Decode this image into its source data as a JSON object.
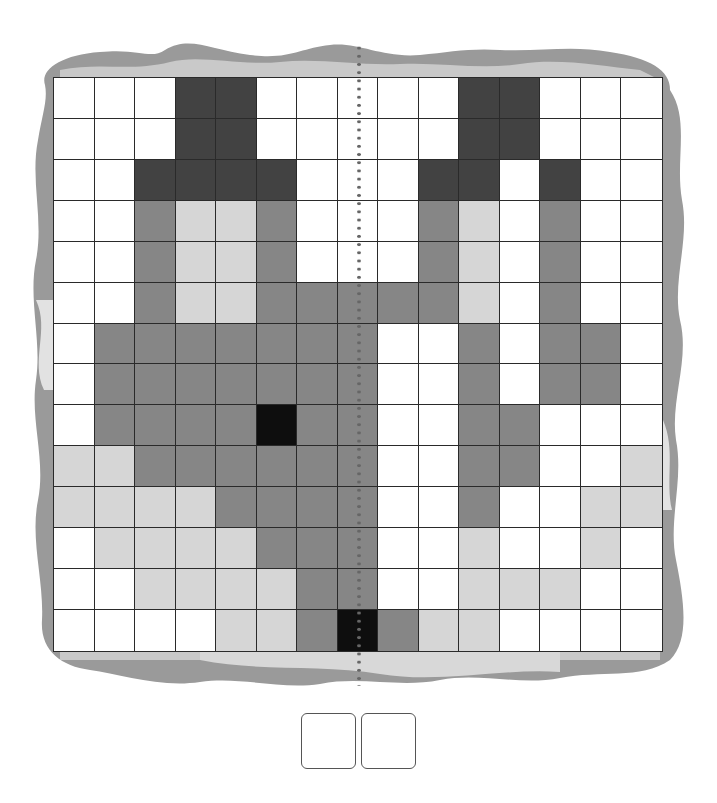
{
  "puzzle": {
    "type": "symmetry-coloring-grid",
    "columns": 15,
    "rows": 14,
    "mirror_axis": "vertical-dotted-line",
    "palette": {
      "W": "#ffffff",
      "L": "#d6d6d6",
      "M": "#868686",
      "D": "#424242",
      "K": "#0e0e0e"
    },
    "cells": [
      "WWWDDWWWWWDDWWW",
      "WWWDDWWWWWDDWWW",
      "WWDDDDWWWDDWDWW",
      "WWMLLMWWWMLWMWW",
      "WWMLLMWWWMLWMWW",
      "WWMLLMMMMMLWMWW",
      "WMMMMMMMWWMWMMW",
      "WMMMMMMMWWMWMMW",
      "WMMMMKMMWWMMWWW",
      "LLMMMMMMWWMMWWL",
      "LLLLMMMMWWMWWLL",
      "WLLLLMMMWWLWWLW",
      "WWLLLLMMWWLLLWW",
      "WWWWLLMKMLLWWWW"
    ]
  },
  "answer_boxes": [
    {
      "value": ""
    },
    {
      "value": ""
    }
  ]
}
